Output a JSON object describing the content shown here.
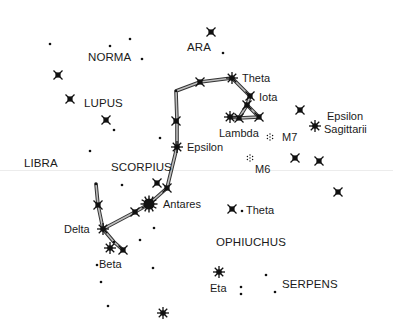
{
  "colors": {
    "background": "#ffffff",
    "ink": "#111111",
    "line_fill": "#bdbdbd"
  },
  "constellations": [
    {
      "name": "NORMA",
      "x": 88,
      "y": 51
    },
    {
      "name": "ARA",
      "x": 187,
      "y": 41
    },
    {
      "name": "LUPUS",
      "x": 84,
      "y": 97
    },
    {
      "name": "LIBRA",
      "x": 24,
      "y": 157
    },
    {
      "name": "SCORPIUS",
      "x": 111,
      "y": 161
    },
    {
      "name": "OPHIUCHUS",
      "x": 216,
      "y": 236
    },
    {
      "name": "SERPENS",
      "x": 282,
      "y": 278
    }
  ],
  "star_labels": [
    {
      "name": "Theta",
      "x": 242,
      "y": 72
    },
    {
      "name": "Iota",
      "x": 259,
      "y": 91
    },
    {
      "name": "Lambda",
      "x": 219,
      "y": 127
    },
    {
      "name": "M7",
      "x": 282,
      "y": 131
    },
    {
      "name": "M6",
      "x": 255,
      "y": 163
    },
    {
      "name": "Epsilon",
      "x": 187,
      "y": 141
    },
    {
      "name": "Epsilon",
      "x": 327,
      "y": 110
    },
    {
      "name": "Sagittarii",
      "x": 324,
      "y": 123
    },
    {
      "name": "Antares",
      "x": 163,
      "y": 198
    },
    {
      "name": "Theta",
      "x": 246,
      "y": 204
    },
    {
      "name": "Delta",
      "x": 64,
      "y": 223
    },
    {
      "name": "Beta",
      "x": 99,
      "y": 258
    },
    {
      "name": "Eta",
      "x": 210,
      "y": 282
    }
  ],
  "stars": {
    "cross": [
      [
        211,
        32
      ],
      [
        58,
        75
      ],
      [
        70,
        99
      ],
      [
        106,
        120
      ],
      [
        200,
        82
      ],
      [
        176,
        121
      ],
      [
        250,
        96
      ],
      [
        247,
        105
      ],
      [
        259,
        117
      ],
      [
        239,
        118
      ],
      [
        300,
        110
      ],
      [
        295,
        158
      ],
      [
        319,
        161
      ],
      [
        338,
        192
      ],
      [
        232,
        209
      ],
      [
        167,
        188
      ],
      [
        135,
        212
      ],
      [
        98,
        205
      ],
      [
        123,
        250
      ],
      [
        157,
        183
      ]
    ],
    "burst": [
      [
        232,
        78
      ],
      [
        177,
        147
      ],
      [
        230,
        117
      ],
      [
        315,
        126
      ],
      [
        103,
        229
      ],
      [
        110,
        248
      ],
      [
        219,
        272
      ],
      [
        163,
        313
      ]
    ],
    "big": [
      [
        149,
        204
      ]
    ],
    "dot": [
      [
        50,
        44
      ],
      [
        110,
        46
      ],
      [
        130,
        39
      ],
      [
        142,
        59
      ],
      [
        223,
        53
      ],
      [
        114,
        130
      ],
      [
        90,
        151
      ],
      [
        160,
        138
      ],
      [
        176,
        91
      ],
      [
        96,
        184
      ],
      [
        122,
        185
      ],
      [
        154,
        228
      ],
      [
        140,
        240
      ],
      [
        114,
        242
      ],
      [
        97,
        265
      ],
      [
        153,
        268
      ],
      [
        101,
        282
      ],
      [
        108,
        306
      ],
      [
        242,
        211
      ],
      [
        266,
        275
      ],
      [
        241,
        287
      ],
      [
        241,
        294
      ],
      [
        275,
        292
      ]
    ],
    "cluster": [
      [
        270,
        137
      ],
      [
        250,
        158
      ]
    ]
  },
  "lines": [
    [
      [
        177,
        147
      ],
      [
        177,
        121
      ],
      [
        176,
        91
      ],
      [
        200,
        82
      ],
      [
        232,
        78
      ],
      [
        250,
        96
      ],
      [
        247,
        105
      ]
    ],
    [
      [
        247,
        105
      ],
      [
        239,
        118
      ],
      [
        259,
        117
      ],
      [
        247,
        105
      ]
    ],
    [
      [
        239,
        118
      ],
      [
        230,
        117
      ]
    ],
    [
      [
        177,
        147
      ],
      [
        167,
        188
      ],
      [
        149,
        204
      ],
      [
        135,
        212
      ],
      [
        103,
        229
      ],
      [
        98,
        205
      ],
      [
        96,
        184
      ]
    ],
    [
      [
        103,
        229
      ],
      [
        114,
        242
      ],
      [
        123,
        250
      ]
    ]
  ]
}
